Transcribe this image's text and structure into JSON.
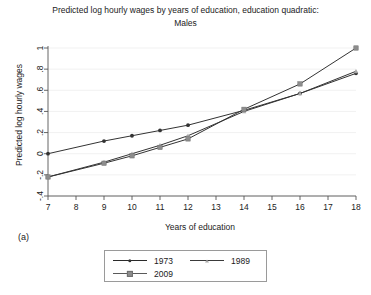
{
  "chart_data": {
    "type": "line",
    "title": "Predicted log hourly wages by years of education, education quadratic:",
    "subtitle": "Males",
    "xlabel": "Years of education",
    "ylabel": "Predicted log hourly wages",
    "panel_label": "(a)",
    "x": [
      7,
      9,
      10,
      11,
      12,
      14,
      16,
      18
    ],
    "xlim": [
      7,
      18
    ],
    "ylim": [
      -0.4,
      1.0
    ],
    "xticks": [
      "7",
      "8",
      "9",
      "10",
      "11",
      "12",
      "13",
      "14",
      "15",
      "16",
      "17",
      "18"
    ],
    "yticks": [
      "1",
      ".8",
      ".6",
      ".4",
      ".2",
      "0",
      "-.2",
      "-.4"
    ],
    "ytick_values": [
      1,
      0.8,
      0.6,
      0.4,
      0.2,
      0,
      -0.2,
      -0.4
    ],
    "grid": "horizontal-light",
    "legend_position": "bottom-outside",
    "series": [
      {
        "name": "1973",
        "marker": "circle",
        "color": "#333333",
        "values": [
          0.0,
          0.12,
          0.17,
          0.22,
          0.27,
          0.41,
          0.57,
          0.76
        ]
      },
      {
        "name": "1989",
        "marker": "triangle",
        "color": "#a8a8a8",
        "values": [
          -0.22,
          -0.08,
          0.0,
          0.08,
          0.17,
          0.4,
          0.57,
          0.78
        ]
      },
      {
        "name": "2009",
        "marker": "square",
        "color": "#8d8d8d",
        "values": [
          -0.22,
          -0.09,
          -0.02,
          0.06,
          0.14,
          0.42,
          0.66,
          1.0
        ]
      }
    ]
  },
  "legend": {
    "entries": [
      {
        "label": "1973"
      },
      {
        "label": "1989"
      },
      {
        "label": "2009"
      }
    ]
  }
}
